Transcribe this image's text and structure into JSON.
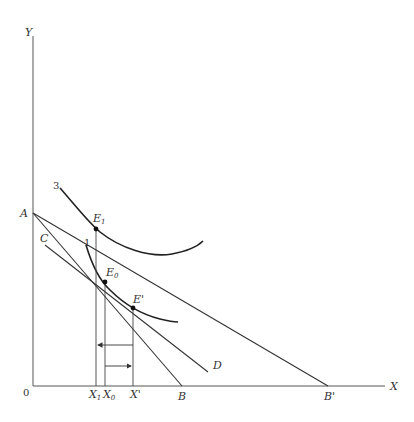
{
  "axes": {
    "y_label": "Y",
    "x_label": "X",
    "origin_label": "0"
  },
  "points": {
    "A": "A",
    "B": "B",
    "B_prime": "B'",
    "C": "C",
    "D": "D",
    "E1": "E",
    "E1_sub": "1",
    "E0": "E",
    "E0_sub": "0",
    "E_prime": "E'"
  },
  "curves": {
    "curve_3": "3",
    "curve_1": "1"
  },
  "x_ticks": {
    "X1": "X",
    "X1_sub": "1",
    "X0": "X",
    "X0_sub": "0",
    "X_prime": "X'"
  },
  "colors": {
    "line": "#333333",
    "curve": "#222222",
    "background": "#ffffff"
  }
}
